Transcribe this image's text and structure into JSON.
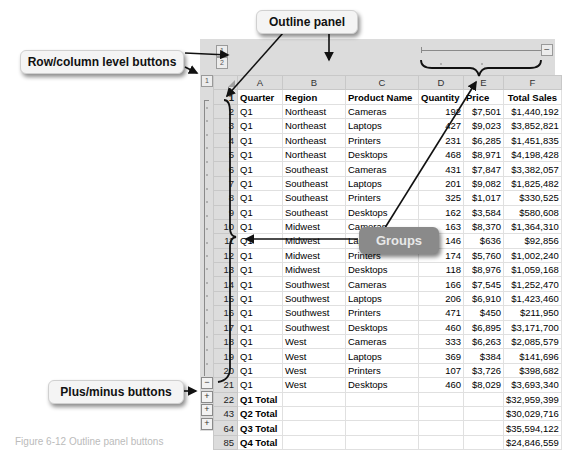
{
  "callouts": {
    "outline_panel": "Outline panel",
    "level_buttons": "Row/column level buttons",
    "groups": "Groups",
    "plus_minus": "Plus/minus buttons"
  },
  "outline": {
    "row_levels": [
      "1",
      "2"
    ],
    "col_levels": [
      "1",
      "2"
    ],
    "column_collapse_button": "−",
    "row_buttons": [
      "−",
      "+",
      "+",
      "+"
    ]
  },
  "columns": [
    "A",
    "B",
    "C",
    "D",
    "E",
    "F"
  ],
  "header_row": {
    "row_number": "1",
    "cells": [
      "Quarter",
      "Region",
      "Product Name",
      "Quantity",
      "Price",
      "Total Sales"
    ]
  },
  "rows": [
    {
      "n": "2",
      "cells": [
        "Q1",
        "Northeast",
        "Cameras",
        "192",
        "$7,501",
        "$1,440,192"
      ]
    },
    {
      "n": "3",
      "cells": [
        "Q1",
        "Northeast",
        "Laptops",
        "427",
        "$9,023",
        "$3,852,821"
      ]
    },
    {
      "n": "4",
      "cells": [
        "Q1",
        "Northeast",
        "Printers",
        "231",
        "$6,285",
        "$1,451,835"
      ]
    },
    {
      "n": "5",
      "cells": [
        "Q1",
        "Northeast",
        "Desktops",
        "468",
        "$8,971",
        "$4,198,428"
      ]
    },
    {
      "n": "6",
      "cells": [
        "Q1",
        "Southeast",
        "Cameras",
        "431",
        "$7,847",
        "$3,382,057"
      ]
    },
    {
      "n": "7",
      "cells": [
        "Q1",
        "Southeast",
        "Laptops",
        "201",
        "$9,082",
        "$1,825,482"
      ]
    },
    {
      "n": "8",
      "cells": [
        "Q1",
        "Southeast",
        "Printers",
        "325",
        "$1,017",
        "$330,525"
      ]
    },
    {
      "n": "9",
      "cells": [
        "Q1",
        "Southeast",
        "Desktops",
        "162",
        "$3,584",
        "$580,608"
      ]
    },
    {
      "n": "10",
      "cells": [
        "Q1",
        "Midwest",
        "Cameras",
        "163",
        "$8,370",
        "$1,364,310"
      ]
    },
    {
      "n": "11",
      "cells": [
        "Q1",
        "Midwest",
        "Laptops",
        "146",
        "$636",
        "$92,856"
      ]
    },
    {
      "n": "12",
      "cells": [
        "Q1",
        "Midwest",
        "Printers",
        "174",
        "$5,760",
        "$1,002,240"
      ]
    },
    {
      "n": "13",
      "cells": [
        "Q1",
        "Midwest",
        "Desktops",
        "118",
        "$8,976",
        "$1,059,168"
      ]
    },
    {
      "n": "14",
      "cells": [
        "Q1",
        "Southwest",
        "Cameras",
        "166",
        "$7,545",
        "$1,252,470"
      ]
    },
    {
      "n": "15",
      "cells": [
        "Q1",
        "Southwest",
        "Laptops",
        "206",
        "$6,910",
        "$1,423,460"
      ]
    },
    {
      "n": "16",
      "cells": [
        "Q1",
        "Southwest",
        "Printers",
        "471",
        "$450",
        "$211,950"
      ]
    },
    {
      "n": "17",
      "cells": [
        "Q1",
        "Southwest",
        "Desktops",
        "460",
        "$6,895",
        "$3,171,700"
      ]
    },
    {
      "n": "18",
      "cells": [
        "Q1",
        "West",
        "Cameras",
        "333",
        "$6,263",
        "$2,085,579"
      ]
    },
    {
      "n": "19",
      "cells": [
        "Q1",
        "West",
        "Laptops",
        "369",
        "$384",
        "$141,696"
      ]
    },
    {
      "n": "20",
      "cells": [
        "Q1",
        "West",
        "Printers",
        "107",
        "$3,726",
        "$398,682"
      ]
    },
    {
      "n": "21",
      "cells": [
        "Q1",
        "West",
        "Desktops",
        "460",
        "$8,029",
        "$3,693,340"
      ]
    }
  ],
  "totals": [
    {
      "n": "22",
      "label": "Q1 Total",
      "value": "$32,959,399"
    },
    {
      "n": "43",
      "label": "Q2 Total",
      "value": "$30,029,716"
    },
    {
      "n": "64",
      "label": "Q3 Total",
      "value": "$35,594,122"
    },
    {
      "n": "85",
      "label": "Q4 Total",
      "value": "$24,846,559"
    }
  ],
  "caption": "Figure 6-12  Outline panel buttons"
}
